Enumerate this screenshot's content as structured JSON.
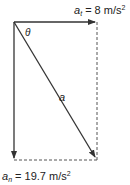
{
  "diagram": {
    "top_label": {
      "symbol": "a",
      "subscript": "t",
      "value": " = 8 m/s",
      "sup": "2"
    },
    "bottom_label": {
      "symbol": "a",
      "subscript": "n",
      "value": " = 19.7 m/s",
      "sup": "2"
    },
    "angle_label": "θ",
    "resultant_label": "a",
    "colors": {
      "line": "#333333",
      "dash": "#555555"
    }
  }
}
